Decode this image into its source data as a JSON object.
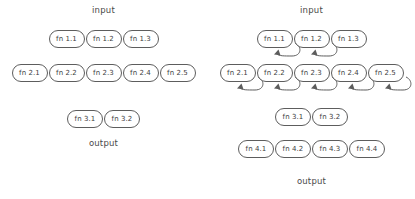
{
  "diagram": {
    "title_left": "",
    "title_right": "",
    "panels": [
      {
        "id": "feedforward",
        "input_label": "input",
        "output_label": "output",
        "rows": [
          {
            "id": "row-1",
            "nodes": [
              {
                "label": "fn 1.1",
                "self_loop": false
              },
              {
                "label": "fn 1.2",
                "self_loop": false
              },
              {
                "label": "fn 1.3",
                "self_loop": false
              }
            ]
          },
          {
            "id": "row-2",
            "nodes": [
              {
                "label": "fn 2.1",
                "self_loop": false
              },
              {
                "label": "fn 2.2",
                "self_loop": false
              },
              {
                "label": "fn 2.3",
                "self_loop": false
              },
              {
                "label": "fn 2.4",
                "self_loop": false
              },
              {
                "label": "fn 2.5",
                "self_loop": false
              }
            ]
          },
          {
            "id": "row-3",
            "nodes": [
              {
                "label": "fn 3.1",
                "self_loop": false
              },
              {
                "label": "fn 3.2",
                "self_loop": false
              }
            ]
          }
        ]
      },
      {
        "id": "feedback",
        "input_label": "input",
        "output_label": "output",
        "rows": [
          {
            "id": "row-1",
            "nodes": [
              {
                "label": "fn 1.1",
                "self_loop": true
              },
              {
                "label": "fn 1.2",
                "self_loop": true
              },
              {
                "label": "fn 1.3",
                "self_loop": false
              }
            ]
          },
          {
            "id": "row-2",
            "nodes": [
              {
                "label": "fn 2.1",
                "self_loop": true
              },
              {
                "label": "fn 2.2",
                "self_loop": true
              },
              {
                "label": "fn 2.3",
                "self_loop": true
              },
              {
                "label": "fn 2.4",
                "self_loop": true
              },
              {
                "label": "fn 2.5",
                "self_loop": true
              }
            ]
          },
          {
            "id": "row-3",
            "nodes": [
              {
                "label": "fn 3.1",
                "self_loop": false
              },
              {
                "label": "fn 3.2",
                "self_loop": false
              }
            ]
          },
          {
            "id": "row-4",
            "nodes": [
              {
                "label": "fn 4.1",
                "self_loop": false
              },
              {
                "label": "fn 4.2",
                "self_loop": false
              },
              {
                "label": "fn 4.3",
                "self_loop": false
              },
              {
                "label": "fn 4.4",
                "self_loop": false
              }
            ]
          }
        ]
      }
    ],
    "colors": {
      "background": "#ffffff",
      "node_stroke": "#5d5d5d",
      "node_fill": "#ffffff",
      "text": "#3d3d3d",
      "arrow": "#5d5d5d"
    },
    "layout": {
      "left_panel_row_tops": [
        30,
        64,
        110
      ],
      "left_panel_input_top": 5,
      "left_panel_output_top": 138,
      "right_panel_row_tops": [
        30,
        64,
        108,
        140
      ],
      "right_panel_input_top": 5,
      "right_panel_output_top": 176
    }
  }
}
